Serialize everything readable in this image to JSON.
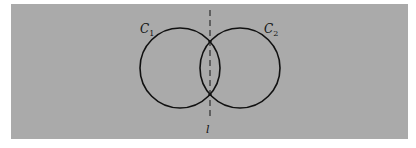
{
  "figure": {
    "background": "#aaaaaa",
    "stroke": "#111111",
    "circles": [
      {
        "label": "C",
        "subscript": "1",
        "cx": 180,
        "cy": 68,
        "r": 40
      },
      {
        "label": "C",
        "subscript": "2",
        "cx": 240,
        "cy": 68,
        "r": 40
      }
    ],
    "line": {
      "label": "l",
      "x": 210,
      "y1": 10,
      "y2": 120,
      "style": "dashed"
    }
  }
}
